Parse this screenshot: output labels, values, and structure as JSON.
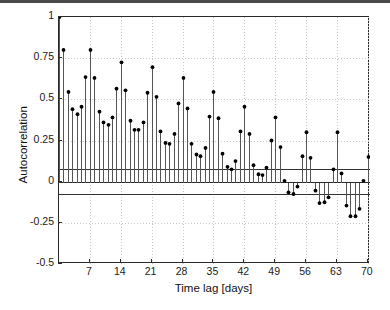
{
  "figure": {
    "background_color": "#ffffff",
    "axes_color": "#2a2a2a",
    "stem_color": "#555555",
    "marker_color": "#000000",
    "grid_color": "#c8c8c8",
    "bound_color": "#333333"
  },
  "axes": {
    "xlabel": "Time lag [days]",
    "ylabel": "Autocorrelation",
    "xticks": [
      7,
      14,
      21,
      28,
      35,
      42,
      49,
      56,
      63,
      70
    ],
    "xtick_labels": [
      "7",
      "14",
      "21",
      "28",
      "35",
      "42",
      "49",
      "56",
      "63",
      "70"
    ],
    "yticks": [
      1,
      0.75,
      0.5,
      0.25,
      0,
      -0.25,
      -0.5
    ],
    "ytick_labels": [
      "1",
      "0.75",
      "0.5",
      "0.25",
      "0",
      "-0.25",
      "-0.5"
    ],
    "xlim": [
      0,
      70.5
    ],
    "ylim": [
      -0.5,
      1.0
    ]
  },
  "chart_data": {
    "type": "line",
    "plot_style": "stem",
    "title": "",
    "xlabel": "Time lag [days]",
    "ylabel": "Autocorrelation",
    "xlim": [
      0,
      70.5
    ],
    "ylim": [
      -0.5,
      1.0
    ],
    "grid": true,
    "legend": null,
    "confidence_bounds": {
      "upper": 0.075,
      "lower": -0.075,
      "label": "95% confidence bounds"
    },
    "x": [
      0,
      1,
      2,
      3,
      4,
      5,
      6,
      7,
      8,
      9,
      10,
      11,
      12,
      13,
      14,
      15,
      16,
      17,
      18,
      19,
      20,
      21,
      22,
      23,
      24,
      25,
      26,
      27,
      28,
      29,
      30,
      31,
      32,
      33,
      34,
      35,
      36,
      37,
      38,
      39,
      40,
      41,
      42,
      43,
      44,
      45,
      46,
      47,
      48,
      49,
      50,
      51,
      52,
      53,
      54,
      55,
      56,
      57,
      58,
      59,
      60,
      61,
      62,
      63,
      64,
      65,
      66,
      67,
      68,
      69,
      70
    ],
    "y": [
      1.0,
      0.8,
      0.545,
      0.44,
      0.41,
      0.455,
      0.635,
      0.8,
      0.63,
      0.425,
      0.36,
      0.345,
      0.39,
      0.565,
      0.725,
      0.555,
      0.37,
      0.315,
      0.315,
      0.36,
      0.54,
      0.695,
      0.515,
      0.305,
      0.235,
      0.23,
      0.29,
      0.475,
      0.63,
      0.445,
      0.23,
      0.165,
      0.155,
      0.205,
      0.395,
      0.545,
      0.385,
      0.17,
      0.09,
      0.075,
      0.125,
      0.305,
      0.455,
      0.29,
      0.1,
      0.045,
      0.04,
      0.085,
      0.25,
      0.39,
      0.21,
      0.005,
      -0.065,
      -0.075,
      -0.03,
      0.155,
      0.3,
      0.145,
      -0.055,
      -0.13,
      -0.125,
      -0.095,
      0.075,
      0.3,
      0.05,
      -0.145,
      -0.21,
      -0.21,
      -0.165,
      0.005,
      0.15
    ],
    "series_name": "autocorrelation"
  }
}
